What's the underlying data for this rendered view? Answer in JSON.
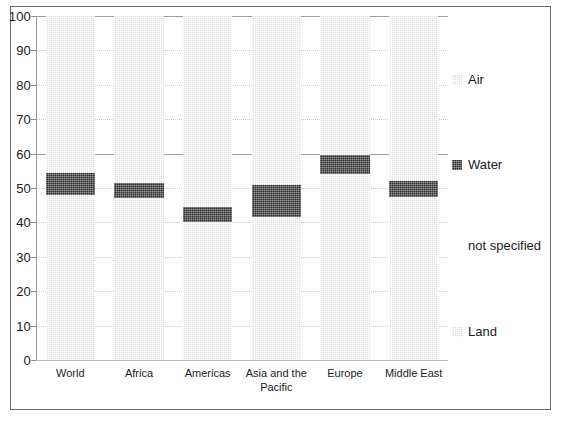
{
  "chart_data": {
    "type": "bar",
    "title": "",
    "subtitle": "",
    "xlabel": "",
    "ylabel": "",
    "ylim": [
      0,
      100
    ],
    "ytick_labels": [
      "100",
      "90",
      "80",
      "70",
      "60",
      "50",
      "40",
      "30",
      "20",
      "10",
      "0"
    ],
    "ytick_values": [
      100,
      90,
      80,
      70,
      60,
      50,
      40,
      30,
      20,
      10,
      0
    ],
    "grid": true,
    "grid_axis": "y",
    "legend_position": "right",
    "stacked": true,
    "categories": [
      "World",
      "Africa",
      "Americas",
      "Asia and the Pacific",
      "Europe",
      "Middle East"
    ],
    "series": [
      {
        "name": "Land",
        "color": "#e2e2e2",
        "values": [
          48.0,
          47.0,
          40.0,
          41.5,
          54.0,
          47.5
        ]
      },
      {
        "name": "Water",
        "color": "#2b2b2b",
        "values": [
          6.5,
          4.5,
          4.5,
          9.5,
          5.5,
          4.5
        ]
      },
      {
        "name": "not specified",
        "color": "#ffffff",
        "values": [
          0,
          0,
          0,
          0,
          0,
          0
        ]
      },
      {
        "name": "Air",
        "color": "#e2e2e2",
        "values": [
          45.5,
          48.5,
          55.5,
          49.0,
          40.5,
          48.0
        ]
      }
    ],
    "band_ranges": [
      {
        "category": "World",
        "water_start": 48.0,
        "water_end": 54.5
      },
      {
        "category": "Africa",
        "water_start": 47.0,
        "water_end": 51.5
      },
      {
        "category": "Americas",
        "water_start": 40.0,
        "water_end": 44.5
      },
      {
        "category": "Asia and the Pacific",
        "water_start": 41.5,
        "water_end": 51.0
      },
      {
        "category": "Europe",
        "water_start": 54.0,
        "water_end": 59.5
      },
      {
        "category": "Middle East",
        "water_start": 47.5,
        "water_end": 52.0
      }
    ]
  },
  "axis": {
    "y_ticks": [
      {
        "label": "100",
        "value": 100
      },
      {
        "label": "90",
        "value": 90
      },
      {
        "label": "80",
        "value": 80
      },
      {
        "label": "70",
        "value": 70
      },
      {
        "label": "60",
        "value": 60
      },
      {
        "label": "50",
        "value": 50
      },
      {
        "label": "40",
        "value": 40
      },
      {
        "label": "30",
        "value": 30
      },
      {
        "label": "20",
        "value": 20
      },
      {
        "label": "10",
        "value": 10
      },
      {
        "label": "0",
        "value": 0
      }
    ]
  },
  "legend": {
    "items": [
      {
        "label": "Air",
        "swatch": "light",
        "y": 56
      },
      {
        "label": "Water",
        "swatch": "dark",
        "y": 141
      },
      {
        "label": "not specified",
        "swatch": "none",
        "y": 222
      },
      {
        "label": "Land",
        "swatch": "light",
        "y": 308
      }
    ]
  },
  "colors": {
    "light_fill": "#e2e2e2",
    "dark_fill": "#2b2b2b",
    "frame": "#6b6b6b",
    "grid": "#c9c9c9",
    "axis": "#9a9a9a",
    "text": "#1b1b1b"
  }
}
